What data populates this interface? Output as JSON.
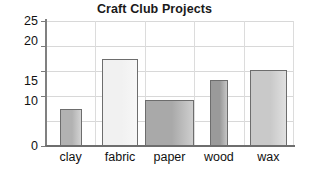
{
  "chart_data": {
    "type": "bar",
    "title": "Craft Club Projects",
    "xlabel": "",
    "ylabel": "",
    "categories": [
      "clay",
      "fabric",
      "paper",
      "wood",
      "wax"
    ],
    "values": [
      7.5,
      17.5,
      9.3,
      13.3,
      15.2
    ],
    "ylim": [
      0,
      25
    ],
    "ytick_labels": [
      "0",
      "10",
      "15",
      "20",
      "25"
    ],
    "ytick_values": [
      0,
      10,
      15,
      20,
      25
    ],
    "grid": "both",
    "legend": "none",
    "bar_colors": [
      "#b2b2b2",
      "#f1f1f1",
      "#a9a9a9",
      "#9a9a9a",
      "#c9c9c9"
    ],
    "bar_edge_color": "#6d6d6d"
  },
  "axis": {
    "tick_0": "0",
    "tick_10": "10",
    "tick_15": "15",
    "tick_20": "20",
    "tick_25": "25"
  },
  "labels": {
    "clay": "clay",
    "fabric": "fabric",
    "paper": "paper",
    "wood": "wood",
    "wax": "wax"
  }
}
